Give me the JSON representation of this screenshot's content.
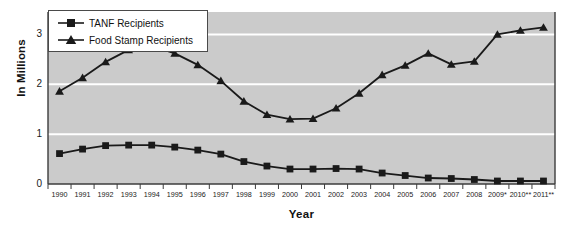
{
  "chart_data": {
    "type": "line",
    "title": "",
    "xlabel": "Year",
    "ylabel": "In Millions",
    "ylim": [
      0,
      3.45
    ],
    "yticks": [
      0,
      1,
      2,
      3
    ],
    "ytick_labels": [
      "0",
      "1",
      "2",
      "3"
    ],
    "grid": "horizontal-white",
    "legend_position": "top-left",
    "categories": [
      "1990",
      "1991",
      "1992",
      "1993",
      "1994",
      "1995",
      "1996",
      "1997",
      "1998",
      "1999",
      "2000",
      "2001",
      "2002",
      "2003",
      "2004",
      "2005",
      "2006",
      "2007",
      "2008",
      "2009*",
      "2010**",
      "2011**"
    ],
    "series": [
      {
        "name": "TANF Recipients",
        "marker": "square",
        "color": "#1a1a1a",
        "values": [
          0.61,
          0.7,
          0.77,
          0.78,
          0.78,
          0.74,
          0.68,
          0.6,
          0.45,
          0.36,
          0.3,
          0.3,
          0.31,
          0.3,
          0.22,
          0.17,
          0.12,
          0.11,
          0.09,
          0.06,
          0.06,
          0.06
        ]
      },
      {
        "name": "Food Stamp Recipients",
        "marker": "triangle",
        "color": "#1a1a1a",
        "values": [
          1.86,
          2.13,
          2.45,
          2.69,
          2.77,
          2.62,
          2.39,
          2.07,
          1.66,
          1.39,
          1.3,
          1.31,
          1.52,
          1.82,
          2.19,
          2.38,
          2.62,
          2.4,
          2.46,
          3.0,
          3.08,
          3.14
        ]
      }
    ]
  },
  "legend": {
    "items": [
      {
        "label": "TANF Recipients",
        "marker": "square"
      },
      {
        "label": "Food Stamp Recipients",
        "marker": "triangle"
      }
    ]
  },
  "axes": {
    "y_title": "In Millions",
    "x_title": "Year"
  },
  "colors": {
    "plot_background": "#cbcbcb",
    "gridline": "#ffffff",
    "axis_line": "#3c3c3c",
    "series_line": "#1a1a1a",
    "page_background": "#ffffff"
  }
}
